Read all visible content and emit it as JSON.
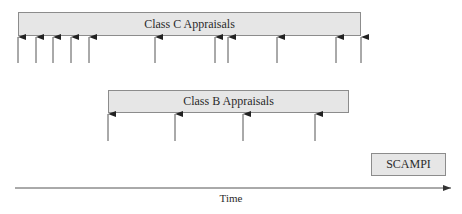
{
  "diagram": {
    "class_c": {
      "label": "Class C Appraisals",
      "box": {
        "x": 18,
        "y": 12,
        "w": 343,
        "h": 24
      },
      "arrows_x": [
        18,
        36,
        53,
        71,
        89,
        155,
        215,
        228,
        277,
        336,
        361
      ],
      "arrow_top": 36,
      "arrow_bottom": 63
    },
    "class_b": {
      "label": "Class B Appraisals",
      "box": {
        "x": 108,
        "y": 90,
        "w": 241,
        "h": 23
      },
      "arrows_x": [
        108,
        175,
        243,
        315
      ],
      "arrow_top": 113,
      "arrow_bottom": 141
    },
    "scampi": {
      "label": "SCAMPI",
      "box": {
        "x": 371,
        "y": 153,
        "w": 75,
        "h": 23
      }
    },
    "time_axis": {
      "label": "Time",
      "x1": 15,
      "x2": 451,
      "y": 188
    },
    "colors": {
      "box_fill": "#e6e6e6",
      "box_border": "#8c8c8c",
      "arrow": "#555555",
      "text": "#2a2a2a"
    }
  }
}
